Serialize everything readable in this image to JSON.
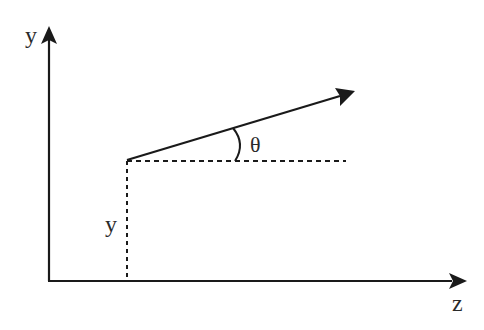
{
  "diagram": {
    "title": "",
    "axes": {
      "vertical": {
        "label": "y"
      },
      "horizontal": {
        "label": "z"
      }
    },
    "vector": {
      "origin_height_label": "y",
      "angle_label": "θ"
    },
    "colors": {
      "stroke": "#1a1a1a",
      "text": "#2a2a2a",
      "background": "#ffffff"
    }
  }
}
